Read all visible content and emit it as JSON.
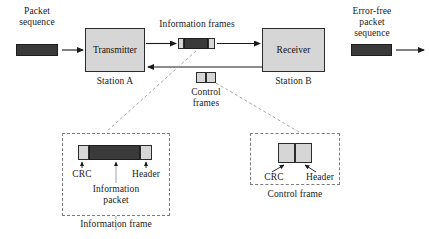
{
  "diagram": {
    "colors": {
      "box_fill": "#d6d6d6",
      "dark_fill": "#3a3a3a",
      "stroke": "#2b2b2b",
      "dashed": "#7d7d7d",
      "text": "#1a1a1a"
    }
  },
  "labels": {
    "packet_sequence": "Packet\nsequence",
    "information_frames": "Information frames",
    "error_free_packet_sequence": "Error-free\npacket\nsequence",
    "control_frames": "Control\nframes",
    "station_a": "Station A",
    "station_b": "Station B",
    "transmitter": "Transmitter",
    "receiver": "Receiver"
  },
  "detail_left": {
    "crc": "CRC",
    "header": "Header",
    "information_packet": "Information\npacket",
    "caption": "Information frame"
  },
  "detail_right": {
    "crc": "CRC",
    "header": "Header",
    "caption": "Control frame"
  },
  "icons": {
    "arrow_right": "arrow-right-icon",
    "arrow_left": "arrow-left-icon",
    "arrow_up": "arrow-up-icon",
    "leader_line": "dashed-leader-line"
  }
}
